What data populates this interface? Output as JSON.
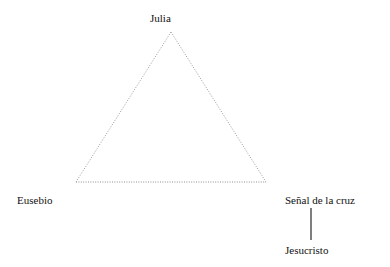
{
  "diagram": {
    "type": "relationship-triangle",
    "background_color": "#ffffff",
    "width": 390,
    "height": 267,
    "nodes": [
      {
        "id": "julia",
        "label": "Julia",
        "x": 171,
        "y": 32,
        "role": "apex"
      },
      {
        "id": "eusebio",
        "label": "Eusebio",
        "x": 76,
        "y": 182,
        "role": "bottom-left"
      },
      {
        "id": "senal",
        "label": "Señal de la cruz",
        "x": 266,
        "y": 182,
        "role": "bottom-right"
      },
      {
        "id": "jesucristo",
        "label": "Jesucristo",
        "x": 311,
        "y": 250,
        "role": "pendant"
      }
    ],
    "edges": [
      {
        "from": "julia",
        "to": "eusebio",
        "style": "dotted",
        "color": "#9a9a9a"
      },
      {
        "from": "julia",
        "to": "senal",
        "style": "dotted",
        "color": "#9a9a9a"
      },
      {
        "from": "eusebio",
        "to": "senal",
        "style": "dotted",
        "color": "#9a9a9a"
      },
      {
        "from": "senal",
        "to": "jesucristo",
        "style": "solid",
        "color": "#3a3a3a"
      }
    ],
    "geometry": {
      "apex_x": 171,
      "apex_y": 32,
      "left_x": 76,
      "left_y": 182,
      "right_x": 266,
      "right_y": 182,
      "connector_x": 311,
      "connector_top_y": 208,
      "connector_bottom_y": 240
    },
    "colors": {
      "dotted_edge": "#9a9a9a",
      "solid_edge": "#3a3a3a",
      "text": "#111111",
      "background": "#ffffff"
    }
  }
}
